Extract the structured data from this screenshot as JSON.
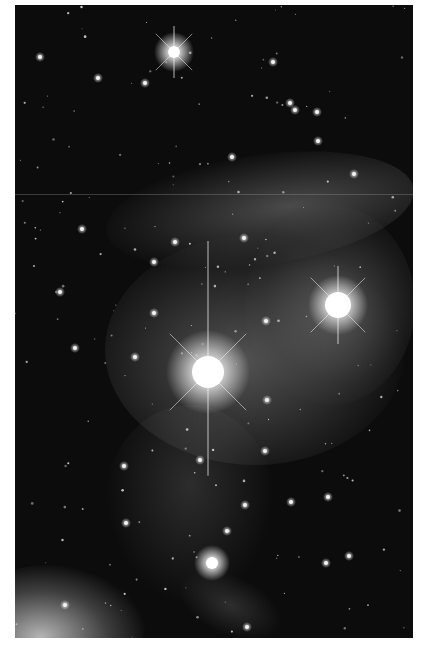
{
  "image": {
    "subject": "star field with reflection nebula (grayscale astrophotograph)",
    "palette": {
      "sky": "#0c0c0c",
      "nebula": "#9a9a9a",
      "star": "#ffffff",
      "frame": "#ffffff"
    },
    "bright_stars": [
      {
        "name": "brightest-star",
        "magnitude_rank": 1,
        "diffraction_spikes": true
      },
      {
        "name": "second-bright-star",
        "magnitude_rank": 2,
        "diffraction_spikes": true
      },
      {
        "name": "upper-star",
        "magnitude_rank": 3,
        "diffraction_spikes": true
      },
      {
        "name": "lower-star",
        "magnitude_rank": 4,
        "diffraction_spikes": false
      }
    ]
  }
}
